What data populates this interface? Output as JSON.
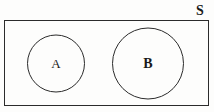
{
  "figure": {
    "type": "venn-diagram",
    "background_color": "#fdfdfc",
    "stroke_color": "#2b2b2b"
  },
  "universe": {
    "label": "S",
    "shape": "rectangle",
    "x": 4,
    "y": 20,
    "width": 205,
    "height": 86,
    "label_x": 200,
    "label_y": 11
  },
  "sets": [
    {
      "label": "A",
      "shape": "circle",
      "cx": 56,
      "cy": 63.5,
      "r": 28.5,
      "fill": "none"
    },
    {
      "label": "B",
      "shape": "circle",
      "cx": 148,
      "cy": 63.5,
      "r": 35.5,
      "fill": "none"
    }
  ]
}
